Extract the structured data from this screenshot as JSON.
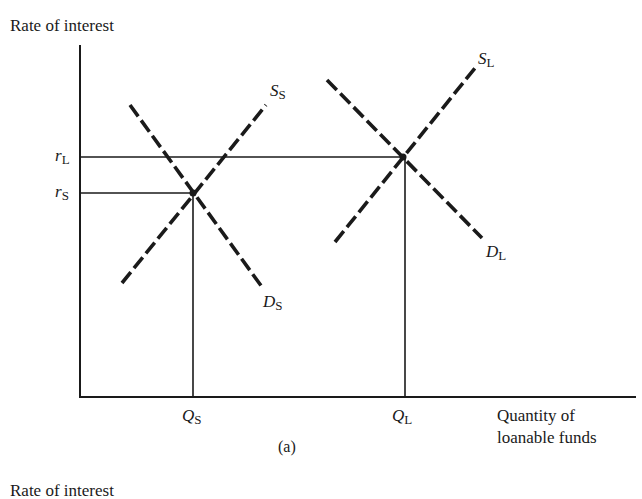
{
  "figure": {
    "panel_label": "(a)",
    "y_axis_title": "Rate of interest",
    "x_axis_title_line1": "Quantity of",
    "x_axis_title_line2": "loanable funds",
    "next_panel_y_axis_title": "Rate of interest"
  },
  "labels": {
    "r_L": {
      "main": "r",
      "sub": "L"
    },
    "r_S": {
      "main": "r",
      "sub": "S"
    },
    "Q_S": {
      "main": "Q",
      "sub": "S"
    },
    "Q_L": {
      "main": "Q",
      "sub": "L"
    },
    "S_S": {
      "main": "S",
      "sub": "S"
    },
    "D_S": {
      "main": "D",
      "sub": "S"
    },
    "S_L": {
      "main": "S",
      "sub": "L"
    },
    "D_L": {
      "main": "D",
      "sub": "L"
    }
  },
  "colors": {
    "ink": "#1a1a1a",
    "background": "#ffffff"
  }
}
